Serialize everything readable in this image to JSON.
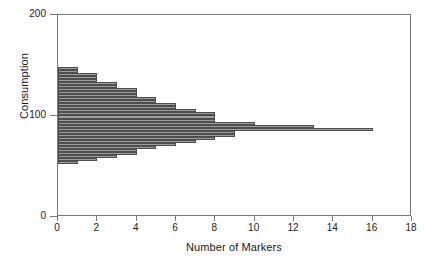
{
  "chart_data": {
    "type": "bar",
    "orientation": "horizontal",
    "title": "",
    "xlabel": "Number of Markers",
    "ylabel": "Consumption",
    "xlim": [
      0,
      18
    ],
    "ylim": [
      0,
      200
    ],
    "xticks": [
      0,
      2,
      4,
      6,
      8,
      10,
      12,
      14,
      16,
      18
    ],
    "yticks": [
      0,
      100,
      200
    ],
    "xtick_labels": [
      "0",
      "2",
      "4",
      "6",
      "8",
      "10",
      "12",
      "14",
      "16",
      "18"
    ],
    "ytick_labels": [
      "0",
      "100",
      "200"
    ],
    "grid": false,
    "legend": null,
    "bar_color": "#9d9d9d",
    "bar_edge_color": "#4d4d4d",
    "frame_color": "#7a7a7a",
    "categories": [
      147,
      144,
      141,
      138,
      135,
      132,
      129,
      126,
      123,
      120,
      117,
      114,
      111,
      108,
      105,
      102,
      99,
      96,
      93,
      90,
      87,
      84,
      81,
      78,
      75,
      72,
      69,
      66,
      63,
      60,
      57,
      54
    ],
    "values": [
      1,
      1,
      2,
      2,
      2,
      3,
      3,
      4,
      4,
      4,
      5,
      5,
      6,
      6,
      7,
      8,
      8,
      8,
      10,
      13,
      16,
      9,
      9,
      8,
      7,
      6,
      5,
      4,
      4,
      3,
      2,
      1
    ],
    "series": [
      {
        "name": "Consumption distribution",
        "values": [
          1,
          1,
          2,
          2,
          2,
          3,
          3,
          4,
          4,
          4,
          5,
          5,
          6,
          6,
          7,
          8,
          8,
          8,
          10,
          13,
          16,
          9,
          9,
          8,
          7,
          6,
          5,
          4,
          4,
          3,
          2,
          1
        ]
      }
    ]
  },
  "axes": {
    "y_label": "Consumption",
    "x_label": "Number of Markers"
  }
}
